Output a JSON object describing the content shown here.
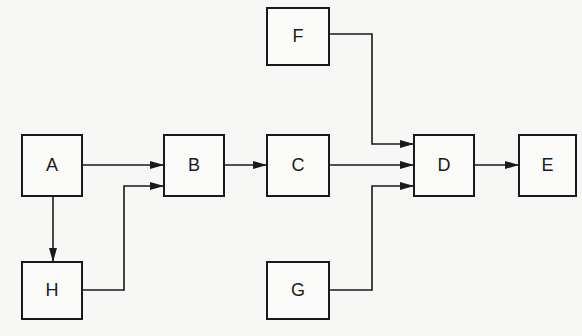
{
  "diagram": {
    "type": "flow-block-diagram",
    "nodes": [
      {
        "id": "F",
        "label": "F",
        "x": 266,
        "y": 7,
        "w": 64,
        "h": 59
      },
      {
        "id": "A",
        "label": "A",
        "x": 21,
        "y": 134,
        "w": 62,
        "h": 63
      },
      {
        "id": "B",
        "label": "B",
        "x": 163,
        "y": 134,
        "w": 62,
        "h": 63
      },
      {
        "id": "C",
        "label": "C",
        "x": 266,
        "y": 134,
        "w": 64,
        "h": 63
      },
      {
        "id": "D",
        "label": "D",
        "x": 413,
        "y": 134,
        "w": 62,
        "h": 63
      },
      {
        "id": "E",
        "label": "E",
        "x": 518,
        "y": 134,
        "w": 59,
        "h": 63
      },
      {
        "id": "H",
        "label": "H",
        "x": 21,
        "y": 261,
        "w": 62,
        "h": 59
      },
      {
        "id": "G",
        "label": "G",
        "x": 266,
        "y": 261,
        "w": 64,
        "h": 59
      }
    ],
    "edges": [
      {
        "from": "A",
        "to": "B"
      },
      {
        "from": "B",
        "to": "C"
      },
      {
        "from": "C",
        "to": "D"
      },
      {
        "from": "D",
        "to": "E"
      },
      {
        "from": "F",
        "to": "D"
      },
      {
        "from": "G",
        "to": "D"
      },
      {
        "from": "A",
        "to": "H"
      },
      {
        "from": "H",
        "to": "B"
      }
    ]
  }
}
